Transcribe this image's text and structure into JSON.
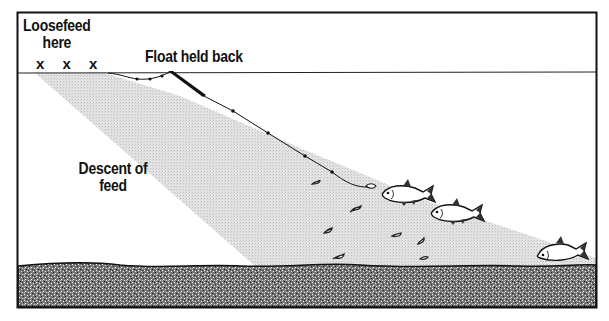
{
  "diagram": {
    "type": "fishing-technique-cross-section",
    "labels": {
      "loosefeed_line1": "Loosefeed",
      "loosefeed_line2": "here",
      "loosefeed_marks": "x x x",
      "float": "Float held back",
      "descent_line1": "Descent of",
      "descent_line2": "feed"
    },
    "elements": {
      "water_surface": "surface line",
      "feed_cone": "stippled descent-of-feed band",
      "float": "float held back at surface",
      "line": "shotted line to hook bait",
      "fish_count": 3,
      "feed_particles": 10,
      "river_bed": "speckled bed"
    },
    "colors": {
      "ink": "#111111",
      "feed_band": "#dcdcdc",
      "background": "#ffffff"
    }
  }
}
